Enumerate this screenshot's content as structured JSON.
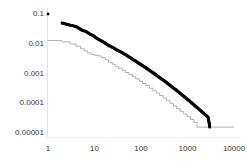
{
  "chart_data": {
    "type": "scatter",
    "title": "",
    "subtitle": "",
    "xlabel": "",
    "ylabel": "",
    "xscale": "log",
    "yscale": "log",
    "xlim": [
      1,
      10000
    ],
    "ylim": [
      1e-05,
      0.1
    ],
    "grid": false,
    "legend": null,
    "xticks": [
      1,
      10,
      100,
      1000,
      10000
    ],
    "xtick_labels": [
      "1",
      "10",
      "100",
      "1000",
      "10000"
    ],
    "yticks": [
      0.1,
      0.01,
      0.001,
      0.0001,
      1e-05
    ],
    "ytick_labels": [
      "0.1",
      "0.01",
      "0.001",
      "0.0001",
      "0.00001"
    ],
    "series": [
      {
        "name": "black-markers",
        "type": "scatter",
        "color": "#000000",
        "marker": "square",
        "marker_size": 2.6,
        "points": [
          [
            1,
            0.1
          ],
          [
            2,
            0.05
          ],
          [
            3,
            0.042
          ],
          [
            4,
            0.038
          ],
          [
            5.5,
            0.028
          ],
          [
            6.5,
            0.026
          ],
          [
            8,
            0.021
          ],
          [
            9.5,
            0.0185
          ],
          [
            11,
            0.0155
          ],
          [
            12.5,
            0.0138
          ],
          [
            14,
            0.0125
          ],
          [
            16,
            0.0112
          ],
          [
            18,
            0.0098
          ],
          [
            20,
            0.0088
          ],
          [
            23,
            0.0079
          ],
          [
            26,
            0.0072
          ],
          [
            30,
            0.0062
          ],
          [
            34,
            0.0056
          ],
          [
            38,
            0.0052
          ],
          [
            43,
            0.0046
          ],
          [
            48,
            0.0042
          ],
          [
            54,
            0.0037
          ],
          [
            61,
            0.0033
          ],
          [
            68,
            0.0029
          ],
          [
            77,
            0.0026
          ],
          [
            86,
            0.0023
          ],
          [
            97,
            0.00205
          ],
          [
            109,
            0.00182
          ],
          [
            122,
            0.00162
          ],
          [
            137,
            0.00143
          ],
          [
            154,
            0.00126
          ],
          [
            173,
            0.00111
          ],
          [
            194,
            0.00098
          ],
          [
            218,
            0.00086
          ],
          [
            245,
            0.00075
          ],
          [
            275,
            0.00066
          ],
          [
            309,
            0.00058
          ],
          [
            347,
            0.00051
          ],
          [
            390,
            0.00044
          ],
          [
            438,
            0.00038
          ],
          [
            492,
            0.00033
          ],
          [
            552,
            0.00029
          ],
          [
            620,
            0.00025
          ],
          [
            697,
            0.000215
          ],
          [
            782,
            0.000185
          ],
          [
            879,
            0.00016
          ],
          [
            987,
            0.000137
          ],
          [
            1108,
            0.000118
          ],
          [
            1245,
            0.000101
          ],
          [
            1398,
            8.65e-05
          ],
          [
            1570,
            7.4e-05
          ],
          [
            1763,
            6.32e-05
          ],
          [
            1980,
            5.4e-05
          ],
          [
            2224,
            4.6e-05
          ],
          [
            2498,
            3.92e-05
          ],
          [
            2805,
            3.33e-05
          ],
          [
            3000,
            1.58e-05
          ]
        ]
      },
      {
        "name": "gray-step-line",
        "type": "line",
        "color": "#a8a8a8",
        "line_width": 0.9,
        "step": true,
        "points": [
          [
            1,
            0.0128
          ],
          [
            2,
            0.0115
          ],
          [
            3,
            0.0098
          ],
          [
            4,
            0.0082
          ],
          [
            5,
            0.0068
          ],
          [
            6,
            0.0058
          ],
          [
            7,
            0.0049
          ],
          [
            8.5,
            0.0044
          ],
          [
            10,
            0.0041
          ],
          [
            12,
            0.0039
          ],
          [
            14,
            0.0034
          ],
          [
            17,
            0.0029
          ],
          [
            20,
            0.0024
          ],
          [
            24,
            0.00205
          ],
          [
            28,
            0.00175
          ],
          [
            33,
            0.0015
          ],
          [
            39,
            0.00128
          ],
          [
            46,
            0.00108
          ],
          [
            55,
            0.00092
          ],
          [
            65,
            0.00078
          ],
          [
            77,
            0.00066
          ],
          [
            91,
            0.00055
          ],
          [
            108,
            0.00046
          ],
          [
            128,
            0.00039
          ],
          [
            152,
            0.00032
          ],
          [
            180,
            0.00027
          ],
          [
            213,
            0.00022
          ],
          [
            252,
            0.000182
          ],
          [
            299,
            0.000149
          ],
          [
            354,
            0.000122
          ],
          [
            419,
            0.0001
          ],
          [
            497,
            8.05e-05
          ],
          [
            588,
            6.55e-05
          ],
          [
            697,
            5.35e-05
          ],
          [
            826,
            4.35e-05
          ],
          [
            978,
            3.52e-05
          ],
          [
            1159,
            2.85e-05
          ],
          [
            1373,
            2.28e-05
          ],
          [
            1600,
            1.58e-05
          ],
          [
            10000,
            1.58e-05
          ]
        ]
      }
    ]
  },
  "axis": {
    "axis_line_color": "#e2e2e2",
    "text_color": "#3b3b3b"
  }
}
